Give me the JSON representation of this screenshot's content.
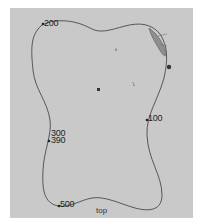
{
  "diagram": {
    "background": "#c9c9c9",
    "outline_color": "#3a3a3a",
    "caption": "top",
    "labels": [
      {
        "text": "200",
        "x": 44,
        "y": 19
      },
      {
        "text": "100",
        "x": 148,
        "y": 114
      },
      {
        "text": "300",
        "x": 51,
        "y": 129
      },
      {
        "text": "390",
        "x": 51,
        "y": 136
      },
      {
        "text": "500",
        "x": 60,
        "y": 200
      }
    ]
  }
}
